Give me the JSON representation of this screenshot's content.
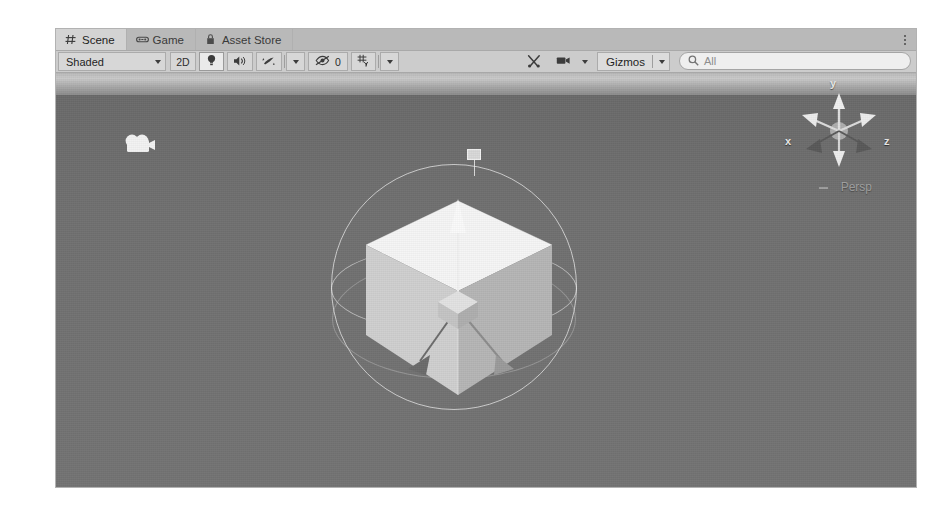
{
  "window": {
    "title": "Unity Editor - Scene View",
    "background_color": "#ffffff",
    "panel_color": "#c8c8c8"
  },
  "tabs": [
    {
      "label": "Scene",
      "icon": "grid-hash-icon",
      "active": true
    },
    {
      "label": "Game",
      "icon": "gamepad-icon",
      "active": false
    },
    {
      "label": "Asset Store",
      "icon": "shopping-bag-icon",
      "active": false
    }
  ],
  "tab_menu": {
    "icon": "kebab-menu-icon",
    "label": ""
  },
  "toolbar": {
    "shading_mode": {
      "label": "Shaded",
      "icon": "chevron-down-icon"
    },
    "two_d_toggle": {
      "label": "2D",
      "active": false
    },
    "lighting_toggle": {
      "icon": "lightbulb-icon",
      "active": true
    },
    "audio_toggle": {
      "icon": "speaker-icon",
      "active": false
    },
    "effects_toggle": {
      "icon": "fx-sparkle-icon",
      "active": false
    },
    "effects_dropdown": {
      "icon": "chevron-down-icon"
    },
    "hidden_objects": {
      "icon": "eye-slash-icon",
      "count": "0"
    },
    "grid_toggle": {
      "icon": "grid-axis-icon"
    },
    "grid_dropdown": {
      "icon": "chevron-down-icon"
    },
    "tools_button": {
      "icon": "tools-wrench-icon"
    },
    "camera_button": {
      "icon": "camera-icon"
    },
    "camera_dropdown": {
      "icon": "chevron-down-icon"
    },
    "gizmos_dropdown": {
      "label": "Gizmos",
      "icon": "chevron-down-icon"
    },
    "search": {
      "value": "All",
      "placeholder": "All",
      "icon": "search-icon"
    }
  },
  "viewport": {
    "sky_color": "#b9b9b9",
    "ground_color": "#707070",
    "scene_objects": [
      {
        "name": "main-camera-gizmo",
        "icon": "camera-gizmo-icon"
      },
      {
        "name": "directional-light-gizmo",
        "icon": "light-gizmo-icon"
      },
      {
        "name": "cube-object",
        "label": "Cube"
      }
    ],
    "transform_gizmo": {
      "type": "move-rotate",
      "axes": [
        "x",
        "y",
        "z"
      ],
      "sphere_visible": true
    }
  },
  "orientation_gizmo": {
    "axis_x": "x",
    "axis_y": "y",
    "axis_z": "z",
    "projection": "Persp",
    "lock_icon": "dash-icon"
  }
}
